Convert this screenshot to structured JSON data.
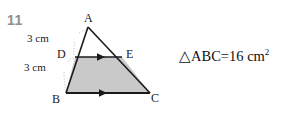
{
  "question": {
    "number": "11"
  },
  "figure": {
    "vertices": {
      "a": "A",
      "b": "B",
      "c": "C",
      "d": "D",
      "e": "E"
    },
    "dimensions": {
      "ad": "3 cm",
      "db": "3 cm"
    }
  },
  "formula": {
    "triangle_symbol": "△",
    "label": "ABC",
    "equals": "=",
    "value": "16",
    "unit": " cm",
    "exponent": "2"
  },
  "colors": {
    "shading": "#c9c9c9",
    "stroke": "#1a1a1a",
    "question_number": "#8e8e8e",
    "leader_line": "#b0b0b0"
  }
}
